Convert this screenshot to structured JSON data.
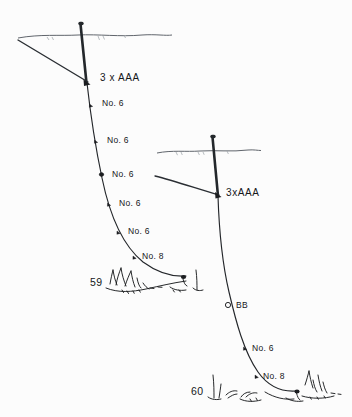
{
  "figure": {
    "background_color": "#fcfcfc",
    "ink_color": "#1b1d20",
    "waterline_color": "#5a5f66"
  },
  "rigs": [
    {
      "id": "left-rig",
      "figure_number": "59",
      "bulk_shot": {
        "label": "3 x AAA",
        "x": 100,
        "y": 79
      },
      "droppers": [
        {
          "label": "No. 6",
          "x": 106,
          "y": 104
        },
        {
          "label": "No. 6",
          "x": 111,
          "y": 141
        },
        {
          "label": "No. 6",
          "x": 116,
          "y": 174
        },
        {
          "label": "No. 6",
          "x": 121,
          "y": 204
        },
        {
          "label": "No. 6",
          "x": 130,
          "y": 232
        },
        {
          "label": "No. 8",
          "x": 145,
          "y": 256
        }
      ]
    },
    {
      "id": "right-rig",
      "figure_number": "60",
      "bulk_shot": {
        "label": "3xAAA",
        "x": 226,
        "y": 193
      },
      "droppers": [
        {
          "label": "BB",
          "x": 238,
          "y": 305
        },
        {
          "label": "No. 6",
          "x": 256,
          "y": 348
        },
        {
          "label": "No. 8",
          "x": 266,
          "y": 377
        }
      ]
    }
  ],
  "labels": {
    "left_bulk": "3 x AAA",
    "right_bulk": "3xAAA",
    "shot_no6": "No. 6",
    "shot_no8": "No. 8",
    "shot_bb": "BB",
    "fig59": "59",
    "fig60": "60"
  },
  "icons": {
    "float": "float-antenna-icon",
    "waterline": "waterline-icon",
    "riverbed": "riverbed-weed-icon",
    "shot": "split-shot-icon",
    "bb_shot": "bb-shot-open-icon"
  }
}
